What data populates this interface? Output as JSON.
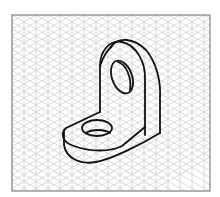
{
  "figure": {
    "grid": {
      "type": "isometric",
      "line_color": "#d0d0d0",
      "border_color": "#808080",
      "spacing_px": 12
    },
    "object": {
      "name": "L-bracket",
      "line_color": "#111111",
      "features": [
        "upright plate with rounded top",
        "upright hole",
        "base plate with rounded end",
        "base hole"
      ]
    }
  }
}
